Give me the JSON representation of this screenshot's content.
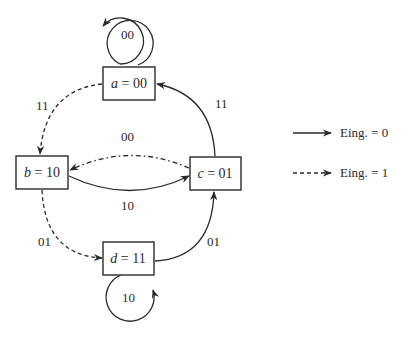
{
  "diagram": {
    "type": "state-transition-diagram",
    "nodes": [
      {
        "id": "a",
        "var": "a",
        "eq": " = ",
        "code": "00"
      },
      {
        "id": "b",
        "var": "b",
        "eq": " = ",
        "code": "10"
      },
      {
        "id": "c",
        "var": "c",
        "eq": " = ",
        "code": "01"
      },
      {
        "id": "d",
        "var": "d",
        "eq": " = ",
        "code": "11"
      }
    ],
    "edges": [
      {
        "from": "a",
        "to": "a",
        "label": "00",
        "style": "solid",
        "kind": "self-loop"
      },
      {
        "from": "a",
        "to": "b",
        "label": "11",
        "style": "dashed"
      },
      {
        "from": "c",
        "to": "a",
        "label": "11",
        "style": "solid"
      },
      {
        "from": "c",
        "to": "b",
        "label": "00",
        "style": "dash-dot"
      },
      {
        "from": "b",
        "to": "c",
        "label": "10",
        "style": "solid"
      },
      {
        "from": "b",
        "to": "d",
        "label": "01",
        "style": "dashed"
      },
      {
        "from": "d",
        "to": "c",
        "label": "01",
        "style": "solid"
      },
      {
        "from": "d",
        "to": "d",
        "label": "10",
        "style": "solid",
        "kind": "self-loop"
      }
    ],
    "legend": [
      {
        "style": "solid",
        "label": "Eing. = 0"
      },
      {
        "style": "dashed",
        "label": "Eing. = 1"
      }
    ],
    "colors": {
      "stroke": "#2a2a2a",
      "background": "#ffffff"
    }
  }
}
